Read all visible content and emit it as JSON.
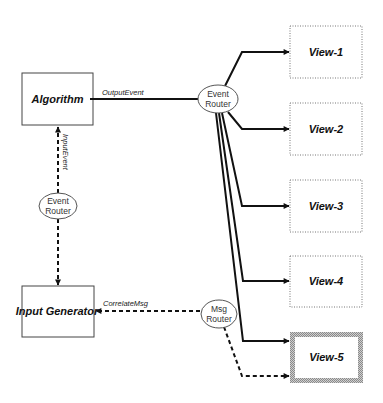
{
  "diagram": {
    "nodes": {
      "algorithm": {
        "label": "Algorithm",
        "type": "component"
      },
      "input_generator": {
        "label": "Input Generator",
        "type": "component"
      },
      "event_router_main": {
        "line1": "Event",
        "line2": "Router",
        "type": "router"
      },
      "event_router_left": {
        "line1": "Event",
        "line2": "Router",
        "type": "router"
      },
      "msg_router": {
        "line1": "Msg",
        "line2": "Router",
        "type": "router"
      },
      "views": [
        {
          "label": "View-1",
          "style": "dotted"
        },
        {
          "label": "View-2",
          "style": "dotted"
        },
        {
          "label": "View-3",
          "style": "dotted"
        },
        {
          "label": "View-4",
          "style": "dotted"
        },
        {
          "label": "View-5",
          "style": "highlighted"
        }
      ]
    },
    "edges": {
      "output_event": {
        "label": "OutputEvent",
        "from": "Algorithm",
        "to": "Event Router",
        "style": "solid"
      },
      "input_event": {
        "label": "InputEvent",
        "from": "Input Generator",
        "to": "Algorithm",
        "style": "dashed"
      },
      "correlate_msg": {
        "label": "CorrelateMsg",
        "from": "Msg Router",
        "to": "Input Generator",
        "style": "dashed"
      }
    }
  }
}
